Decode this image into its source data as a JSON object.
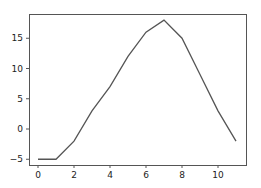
{
  "chart_data": {
    "type": "line",
    "title": "",
    "xlabel": "",
    "ylabel": "",
    "x": [
      0,
      1,
      2,
      3,
      4,
      5,
      6,
      7,
      8,
      9,
      10,
      11
    ],
    "series": [
      {
        "name": "",
        "values": [
          -5,
          -5,
          -2,
          3,
          7,
          12,
          16,
          18,
          15,
          9,
          3,
          -2
        ],
        "color": "#555555"
      }
    ],
    "xlim": [
      -0.5,
      11.5
    ],
    "ylim": [
      -6.2,
      19.1
    ],
    "xticks": [
      0,
      2,
      4,
      6,
      8,
      10
    ],
    "yticks": [
      -5,
      0,
      5,
      10,
      15
    ],
    "grid": false,
    "legend": null
  },
  "layout": {
    "plot_left": 29,
    "plot_top": 14,
    "plot_right": 246,
    "plot_bottom": 165,
    "x0_px": 38,
    "x_px_per_unit": 18,
    "y0_px": 129,
    "y_px_per_unit": 6.05
  }
}
